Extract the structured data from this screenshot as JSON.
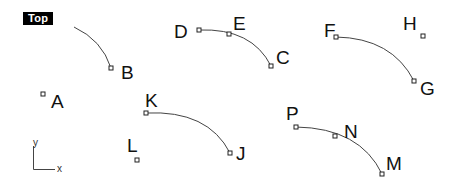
{
  "viewport": {
    "title": "Top",
    "background": "#ffffff"
  },
  "axes": {
    "x_label": "x",
    "y_label": "y"
  },
  "curves": [
    {
      "name": "curve-B",
      "path": "M74,27 Q102,40 111,68"
    },
    {
      "name": "curve-D-E-C",
      "path": "M199,30 Q252,28 271,66"
    },
    {
      "name": "curve-F-G",
      "path": "M336,37 Q392,38 414,81"
    },
    {
      "name": "curve-K-J",
      "path": "M146,113 Q208,110 230,153"
    },
    {
      "name": "curve-P-N-M",
      "path": "M296,127 Q360,128 382,174"
    }
  ],
  "points": [
    {
      "id": "A",
      "label": "A",
      "x": 43,
      "y": 94,
      "lx": 51,
      "ly": 108
    },
    {
      "id": "B",
      "label": "B",
      "x": 111,
      "y": 68,
      "lx": 121,
      "ly": 79
    },
    {
      "id": "C",
      "label": "C",
      "x": 271,
      "y": 66,
      "lx": 276,
      "ly": 64
    },
    {
      "id": "D",
      "label": "D",
      "x": 199,
      "y": 30,
      "lx": 174,
      "ly": 38
    },
    {
      "id": "E",
      "label": "E",
      "x": 229,
      "y": 34,
      "lx": 233,
      "ly": 30
    },
    {
      "id": "F",
      "label": "F",
      "x": 336,
      "y": 37,
      "lx": 324,
      "ly": 37
    },
    {
      "id": "G",
      "label": "G",
      "x": 414,
      "y": 81,
      "lx": 420,
      "ly": 95
    },
    {
      "id": "H",
      "label": "H",
      "x": 423,
      "y": 36,
      "lx": 403,
      "ly": 30
    },
    {
      "id": "J",
      "label": "J",
      "x": 230,
      "y": 153,
      "lx": 236,
      "ly": 160
    },
    {
      "id": "K",
      "label": "K",
      "x": 146,
      "y": 113,
      "lx": 145,
      "ly": 107
    },
    {
      "id": "L",
      "label": "L",
      "x": 137,
      "y": 160,
      "lx": 127,
      "ly": 152
    },
    {
      "id": "M",
      "label": "M",
      "x": 382,
      "y": 174,
      "lx": 386,
      "ly": 170
    },
    {
      "id": "N",
      "label": "N",
      "x": 335,
      "y": 136,
      "lx": 344,
      "ly": 138
    },
    {
      "id": "P",
      "label": "P",
      "x": 296,
      "y": 127,
      "lx": 286,
      "ly": 120
    }
  ]
}
